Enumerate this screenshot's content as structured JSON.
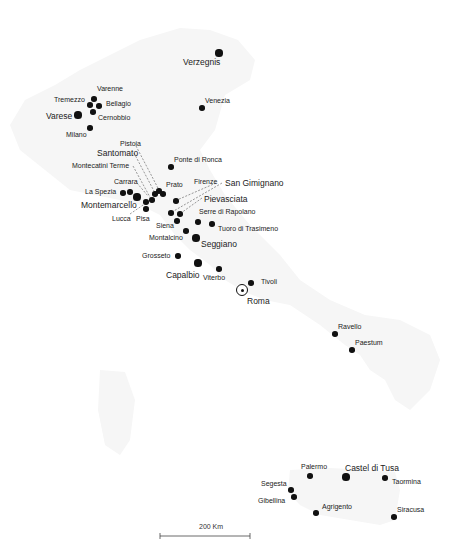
{
  "map": {
    "type": "point-map",
    "region": "Italy",
    "colors": {
      "dot": "#111111",
      "land": "#f7f7f7",
      "leader": "#555555"
    },
    "places": [
      {
        "name": "Verzegnis",
        "x": 219,
        "y": 53,
        "size": "large",
        "lx": 183,
        "ly": 57,
        "big": true
      },
      {
        "name": "Varenne",
        "x": 94,
        "y": 99,
        "size": "small",
        "lx": 97,
        "ly": 85
      },
      {
        "name": "Tremezzo",
        "x": 90,
        "y": 105,
        "size": "small",
        "lx": 54,
        "ly": 96
      },
      {
        "name": "Bellagio",
        "x": 99,
        "y": 106,
        "size": "small",
        "lx": 106,
        "ly": 100
      },
      {
        "name": "Varese",
        "x": 78,
        "y": 115,
        "size": "large",
        "lx": 46,
        "ly": 111,
        "big": true
      },
      {
        "name": "Cernobbio",
        "x": 93,
        "y": 112,
        "size": "small",
        "lx": 98,
        "ly": 114
      },
      {
        "name": "Milano",
        "x": 90,
        "y": 128,
        "size": "small",
        "lx": 66,
        "ly": 131
      },
      {
        "name": "Venezia",
        "x": 202,
        "y": 108,
        "size": "small",
        "lx": 205,
        "ly": 97
      },
      {
        "name": "Pistoia",
        "x": 159,
        "y": 191,
        "size": "small",
        "lx": 120,
        "ly": 140
      },
      {
        "name": "Santomato",
        "x": 155,
        "y": 194,
        "size": "small",
        "lx": 97,
        "ly": 148,
        "big": true
      },
      {
        "name": "Montecatini Terme",
        "x": 152,
        "y": 200,
        "size": "small",
        "lx": 72,
        "ly": 162
      },
      {
        "name": "Ponte di Ronca",
        "x": 171,
        "y": 167,
        "size": "small",
        "lx": 174,
        "ly": 156
      },
      {
        "name": "Carrara",
        "x": 130,
        "y": 192,
        "size": "small",
        "lx": 114,
        "ly": 178
      },
      {
        "name": "Prato",
        "x": 163,
        "y": 194,
        "size": "small",
        "lx": 166,
        "ly": 181
      },
      {
        "name": "La Spezia",
        "x": 123,
        "y": 193,
        "size": "small",
        "lx": 85,
        "ly": 188
      },
      {
        "name": "Montemarcello",
        "x": 137,
        "y": 197,
        "size": "large",
        "lx": 81,
        "ly": 200,
        "big": true
      },
      {
        "name": "Lucca",
        "x": 146,
        "y": 202,
        "size": "small",
        "lx": 112,
        "ly": 215
      },
      {
        "name": "Pisa",
        "x": 146,
        "y": 209,
        "size": "small",
        "lx": 136,
        "ly": 215
      },
      {
        "name": "Firenze",
        "x": 176,
        "y": 201,
        "size": "small",
        "lx": 194,
        "ly": 178
      },
      {
        "name": "San Gimignano",
        "x": 171,
        "y": 213,
        "size": "small",
        "lx": 225,
        "ly": 178,
        "big": true
      },
      {
        "name": "Pievasciata",
        "x": 180,
        "y": 214,
        "size": "small",
        "lx": 204,
        "ly": 194,
        "big": true
      },
      {
        "name": "Serre di Rapolano",
        "x": 198,
        "y": 222,
        "size": "small",
        "lx": 199,
        "ly": 208
      },
      {
        "name": "Siena",
        "x": 177,
        "y": 221,
        "size": "small",
        "lx": 156,
        "ly": 222
      },
      {
        "name": "Tuoro di Trasimeno",
        "x": 212,
        "y": 224,
        "size": "small",
        "lx": 218,
        "ly": 225
      },
      {
        "name": "Montalcino",
        "x": 186,
        "y": 231,
        "size": "small",
        "lx": 149,
        "ly": 234
      },
      {
        "name": "Seggiano",
        "x": 196,
        "y": 238,
        "size": "large",
        "lx": 201,
        "ly": 239,
        "big": true
      },
      {
        "name": "Grosseto",
        "x": 178,
        "y": 256,
        "size": "small",
        "lx": 142,
        "ly": 252
      },
      {
        "name": "Capalbio",
        "x": 198,
        "y": 263,
        "size": "large",
        "lx": 166,
        "ly": 270,
        "big": true
      },
      {
        "name": "Viterbo",
        "x": 219,
        "y": 269,
        "size": "small",
        "lx": 203,
        "ly": 274
      },
      {
        "name": "Tivoli",
        "x": 251,
        "y": 283,
        "size": "small",
        "lx": 261,
        "ly": 278
      },
      {
        "name": "Roma",
        "x": 242,
        "y": 290,
        "size": "capital",
        "lx": 247,
        "ly": 296,
        "big": true
      },
      {
        "name": "Ravello",
        "x": 335,
        "y": 334,
        "size": "small",
        "lx": 338,
        "ly": 323
      },
      {
        "name": "Paestum",
        "x": 352,
        "y": 350,
        "size": "small",
        "lx": 355,
        "ly": 339
      },
      {
        "name": "Palermo",
        "x": 310,
        "y": 476,
        "size": "small",
        "lx": 301,
        "ly": 463
      },
      {
        "name": "Castel di Tusa",
        "x": 346,
        "y": 477,
        "size": "large",
        "lx": 345,
        "ly": 463,
        "big": true
      },
      {
        "name": "Taormina",
        "x": 385,
        "y": 478,
        "size": "small",
        "lx": 392,
        "ly": 478
      },
      {
        "name": "Segesta",
        "x": 291,
        "y": 490,
        "size": "small",
        "lx": 261,
        "ly": 480
      },
      {
        "name": "Gibellina",
        "x": 294,
        "y": 497,
        "size": "small",
        "lx": 258,
        "ly": 497
      },
      {
        "name": "Agrigento",
        "x": 316,
        "y": 513,
        "size": "small",
        "lx": 322,
        "ly": 503
      },
      {
        "name": "Siracusa",
        "x": 394,
        "y": 517,
        "size": "small",
        "lx": 397,
        "ly": 506
      }
    ],
    "leaders": [
      {
        "from": "Pistoia",
        "x1": 136,
        "y1": 146,
        "x2": 159,
        "y2": 190
      },
      {
        "from": "Santomato",
        "x1": 134,
        "y1": 153,
        "x2": 155,
        "y2": 193
      },
      {
        "from": "Montecatini Terme",
        "x1": 133,
        "y1": 166,
        "x2": 151,
        "y2": 199
      },
      {
        "from": "Carrara",
        "x1": 137,
        "y1": 183,
        "x2": 148,
        "y2": 196
      },
      {
        "from": "Lucca",
        "x1": 130,
        "y1": 214,
        "x2": 146,
        "y2": 203
      },
      {
        "from": "Firenze",
        "x1": 216,
        "y1": 183,
        "x2": 177,
        "y2": 200
      },
      {
        "from": "San Gimignano",
        "x1": 222,
        "y1": 183,
        "x2": 172,
        "y2": 212
      },
      {
        "from": "Pievasciata",
        "x1": 202,
        "y1": 198,
        "x2": 181,
        "y2": 213
      }
    ],
    "scale_bar": {
      "label": "200 Km",
      "x1": 160,
      "x2": 250,
      "y": 536
    }
  }
}
